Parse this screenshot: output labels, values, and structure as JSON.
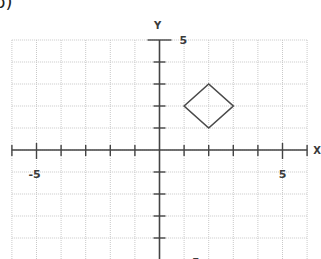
{
  "figure": {
    "part_label": "b)",
    "axis_x_label": "X",
    "axis_y_label": "Y",
    "x_range": [
      -6,
      6
    ],
    "y_range": [
      -5,
      5
    ],
    "labels": {
      "x_neg": "-5",
      "x_pos": "5",
      "y_pos": "5",
      "y_neg": "-5"
    },
    "colors": {
      "grid": "#c9c9c9",
      "axis": "#444444",
      "shape": "#4a4a4a",
      "background": "#ffffff"
    },
    "shape": {
      "type": "diamond",
      "vertices": [
        [
          1,
          2
        ],
        [
          2,
          3
        ],
        [
          3,
          2
        ],
        [
          2,
          1
        ]
      ]
    }
  }
}
